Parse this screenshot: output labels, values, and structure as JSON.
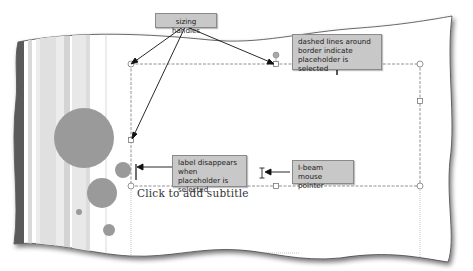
{
  "callouts": {
    "sizing_handles": "sizing handles",
    "dashed_lines": "dashed lines around border indicate placeholder is selected",
    "label_disappears": "label disappears when placeholder is selected",
    "ibeam": "I-beam mouse pointer"
  },
  "slide": {
    "subtitle_placeholder": "Click to add subtitle"
  },
  "colors": {
    "callout_fill": "#c8c8c8",
    "circle_fill": "#9a9a9a",
    "slide_edge": "#555555"
  }
}
